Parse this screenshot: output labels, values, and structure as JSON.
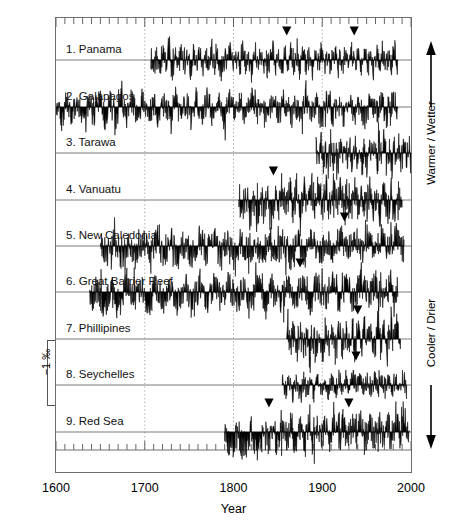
{
  "figure": {
    "axis": {
      "x_title": "Year",
      "y_title_prefix": "Coral ",
      "y_title_delta": "δ",
      "y_title_sup": "18",
      "y_title_suffix": "O‰",
      "x_ticks": [
        1600,
        1700,
        1800,
        1900,
        2000
      ],
      "x_tick_labels": [
        "1600",
        "1700",
        "1800",
        "1900",
        "2000"
      ],
      "x_minor_tick_step": 10,
      "xlim": [
        1600,
        2000
      ],
      "gridlines_dotted_at": [
        1700,
        1800,
        1900
      ]
    },
    "scale_bar": {
      "label": "−1 ‰",
      "value": -1,
      "units": "permil"
    },
    "side_legend": {
      "top_label": "Warmer / Wetter",
      "bottom_label": "Cooler / Drier",
      "up_arrow": "arrow-up-icon",
      "down_arrow": "arrow-down-icon"
    },
    "panels": [
      {
        "index": 1,
        "label": "1. Panama"
      },
      {
        "index": 2,
        "label": "2. Galapagos"
      },
      {
        "index": 3,
        "label": "3. Tarawa"
      },
      {
        "index": 4,
        "label": "4. Vanuatu"
      },
      {
        "index": 5,
        "label": "5. New Caledonia"
      },
      {
        "index": 6,
        "label": "6. Great Barrier Reef"
      },
      {
        "index": 7,
        "label": "7. Phillipines"
      },
      {
        "index": 8,
        "label": "8. Seychelles"
      },
      {
        "index": 9,
        "label": "9. Red Sea"
      }
    ]
  },
  "chart_data": {
    "type": "line",
    "title": "",
    "subtitle": "",
    "xlabel": "Year",
    "ylabel": "Coral δ18O‰",
    "xlim": [
      1600,
      2000
    ],
    "grid": "dotted vertical gridlines at 1700, 1800, 1900",
    "legend": "right-side vertical axis direction labels: Warmer / Wetter (up), Cooler / Drier (down)",
    "orientation_note": "y axis inverted: upward deflection = warmer/wetter (more negative d18O)",
    "scale_bar_permil": -1,
    "annotations": [
      {
        "type": "marker",
        "glyph": "filled-down-triangle",
        "meaning": "marked event year"
      }
    ],
    "series": [
      {
        "name": "1. Panama",
        "baseline_y": 60,
        "start_year": 1707,
        "end_year": 1985,
        "amplitude": 0.62,
        "markers": [
          1860,
          1936
        ],
        "values": [
          0.12,
          -0.35,
          0.28,
          -0.52,
          0.35,
          -0.18,
          0.44,
          -0.62,
          0.22,
          -0.3,
          0.48,
          -0.25,
          0.18,
          -0.55,
          0.33,
          -0.2,
          0.4,
          -0.45,
          0.25,
          -0.38,
          0.5,
          -0.28,
          0.16,
          -0.6,
          0.3,
          -0.22,
          0.42,
          -0.48,
          0.2,
          -0.34,
          0.46,
          -0.26,
          0.14,
          -0.58,
          0.36,
          -0.19,
          0.38,
          -0.5,
          0.24,
          -0.32,
          0.52,
          -0.27,
          0.17,
          -0.56,
          0.31,
          -0.21,
          0.41,
          -0.46,
          0.26,
          -0.36,
          0.49,
          -0.29,
          0.15,
          -0.61,
          0.34,
          -0.23,
          0.43,
          -0.47,
          0.21,
          -0.33,
          0.47,
          -0.24,
          0.19,
          -0.54,
          0.37,
          -0.17,
          0.39,
          -0.51,
          0.27,
          -0.31,
          0.53,
          -0.28,
          0.13,
          -0.59,
          0.32,
          -0.2,
          0.45,
          -0.44,
          0.23,
          -0.37,
          0.51,
          -0.26
        ]
      },
      {
        "name": "2. Galapagos",
        "baseline_y": 107,
        "start_year": 1600,
        "end_year": 1985,
        "amplitude": 0.7,
        "markers": [],
        "values": [
          0.3,
          -0.62,
          0.25,
          -0.48,
          0.4,
          -0.7,
          0.18,
          -0.35,
          0.45,
          -0.55,
          0.22,
          -0.66,
          0.38,
          -0.42,
          0.28,
          -0.58,
          0.48,
          -0.3,
          0.2,
          -0.68,
          0.35,
          -0.45,
          0.42,
          -0.52,
          0.26,
          -0.64,
          0.33,
          -0.38,
          0.46,
          -0.56,
          0.24,
          -0.6,
          0.36,
          -0.44,
          0.29,
          -0.5,
          0.44,
          -0.33,
          0.21,
          -0.69,
          0.39,
          -0.46,
          0.31,
          -0.54,
          0.27,
          -0.62,
          0.43,
          -0.36,
          0.23,
          -0.66,
          0.37,
          -0.49,
          0.34,
          -0.41,
          0.47,
          -0.57,
          0.19,
          -0.63,
          0.41,
          -0.39,
          0.32,
          -0.53,
          0.25,
          -0.61
        ]
      },
      {
        "name": "3. Tarawa",
        "baseline_y": 153,
        "start_year": 1893,
        "end_year": 2000,
        "amplitude": 0.8,
        "markers": [],
        "values": [
          0.35,
          -0.7,
          0.55,
          -0.4,
          0.28,
          -0.8,
          0.62,
          -0.52,
          0.4,
          -0.65,
          0.3,
          -0.45,
          0.7,
          -0.58,
          0.36,
          -0.76,
          0.48,
          -0.38,
          0.58,
          -0.62,
          0.32,
          -0.72,
          0.65,
          -0.44,
          0.42,
          -0.68,
          0.38,
          -0.5,
          0.74,
          -0.56,
          0.34,
          -0.78,
          0.52,
          -0.42,
          0.6,
          -0.64,
          0.45,
          -0.36,
          0.68,
          -0.54
        ]
      },
      {
        "name": "4. Vanuatu",
        "baseline_y": 200,
        "start_year": 1806,
        "end_year": 1990,
        "amplitude": 0.9,
        "markers": [
          1845
        ],
        "values": [
          0.2,
          -0.55,
          0.3,
          -0.85,
          0.18,
          -0.9,
          0.35,
          -0.7,
          0.25,
          -0.88,
          0.42,
          -0.62,
          0.5,
          -0.45,
          0.58,
          -0.38,
          0.62,
          -0.3,
          0.55,
          -0.42,
          0.66,
          -0.28,
          0.6,
          -0.35,
          0.52,
          -0.48,
          0.64,
          -0.32,
          0.58,
          -0.4,
          0.48,
          -0.52,
          0.56,
          -0.36,
          0.44,
          -0.58,
          0.5,
          -0.44,
          0.38,
          -0.66,
          0.46,
          -0.5,
          0.34,
          -0.72,
          0.4,
          -0.56
        ]
      },
      {
        "name": "5. New Caledonia",
        "baseline_y": 246,
        "start_year": 1650,
        "end_year": 1992,
        "amplitude": 0.75,
        "markers": [
          1925
        ],
        "values": [
          0.22,
          -0.4,
          0.3,
          -0.55,
          0.18,
          -0.62,
          0.35,
          -0.45,
          0.26,
          -0.58,
          0.4,
          -0.5,
          0.28,
          -0.66,
          0.33,
          -0.42,
          0.45,
          -0.54,
          0.24,
          -0.6,
          0.38,
          -0.46,
          0.3,
          -0.68,
          0.42,
          -0.38,
          0.27,
          -0.64,
          0.36,
          -0.48,
          0.48,
          -0.52,
          0.32,
          -0.44,
          0.52,
          -0.35,
          0.58,
          -0.28,
          0.55,
          -0.32,
          0.6,
          -0.25,
          0.56,
          -0.3
        ]
      },
      {
        "name": "6. Great Barrier Reef",
        "baseline_y": 292,
        "start_year": 1638,
        "end_year": 1985,
        "amplitude": 0.78,
        "markers": [
          1875
        ],
        "values": [
          -0.55,
          0.18,
          -0.7,
          0.22,
          -0.6,
          0.3,
          -0.48,
          0.26,
          -0.65,
          0.34,
          -0.42,
          0.28,
          -0.58,
          0.36,
          -0.5,
          0.24,
          -0.62,
          0.32,
          -0.44,
          0.4,
          -0.54,
          0.2,
          -0.68,
          0.38,
          -0.46,
          0.3,
          -0.56,
          0.42,
          -0.38,
          0.34,
          -0.6,
          0.45,
          -0.4,
          0.52,
          -0.5,
          0.36,
          -0.44,
          0.56,
          -0.34,
          0.48,
          -0.52,
          0.44,
          -0.3
        ]
      },
      {
        "name": "7. Phillipines",
        "baseline_y": 339,
        "start_year": 1860,
        "end_year": 1988,
        "amplitude": 0.85,
        "markers": [
          1940
        ],
        "values": [
          0.45,
          -0.38,
          0.3,
          -0.62,
          0.55,
          -0.5,
          0.22,
          -0.85,
          0.4,
          -0.55,
          0.34,
          -0.7,
          0.48,
          -0.44,
          0.26,
          -0.78,
          0.58,
          -0.4,
          0.36,
          -0.66,
          0.62,
          -0.48,
          0.42,
          -0.58,
          0.7,
          -0.36,
          0.5,
          -0.52,
          0.66,
          -0.42,
          0.56,
          -0.6,
          0.74,
          -0.34,
          0.6,
          -0.46
        ]
      },
      {
        "name": "8. Seychelles",
        "baseline_y": 385,
        "start_year": 1855,
        "end_year": 1995,
        "amplitude": 0.55,
        "markers": [
          1938
        ],
        "values": [
          0.12,
          -0.3,
          0.18,
          -0.42,
          0.1,
          -0.52,
          0.22,
          -0.36,
          0.14,
          -0.46,
          0.2,
          -0.28,
          0.16,
          -0.5,
          0.24,
          -0.34,
          0.28,
          -0.26,
          0.32,
          -0.22,
          0.36,
          -0.18,
          0.3,
          -0.24,
          0.38,
          -0.2,
          0.34,
          -0.28,
          0.4,
          -0.16,
          0.35,
          -0.26,
          0.42,
          -0.22,
          0.38,
          -0.18
        ]
      },
      {
        "name": "9. Red Sea",
        "baseline_y": 432,
        "start_year": 1790,
        "end_year": 1998,
        "amplitude": 0.8,
        "markers": [
          1840,
          1930
        ],
        "values": [
          0.15,
          -0.5,
          -0.68,
          0.1,
          -0.75,
          -0.55,
          0.2,
          -0.8,
          -0.62,
          0.12,
          -0.58,
          0.25,
          -0.7,
          0.18,
          -0.45,
          0.28,
          -0.52,
          0.22,
          -0.38,
          0.34,
          -0.44,
          0.26,
          -0.36,
          0.4,
          -0.4,
          0.3,
          -0.32,
          0.46,
          -0.38,
          0.52,
          -0.28,
          0.58,
          -0.34,
          0.48,
          -0.26,
          0.62,
          -0.3,
          0.54,
          -0.24,
          0.66,
          -0.32,
          0.5,
          -0.22
        ]
      }
    ]
  }
}
